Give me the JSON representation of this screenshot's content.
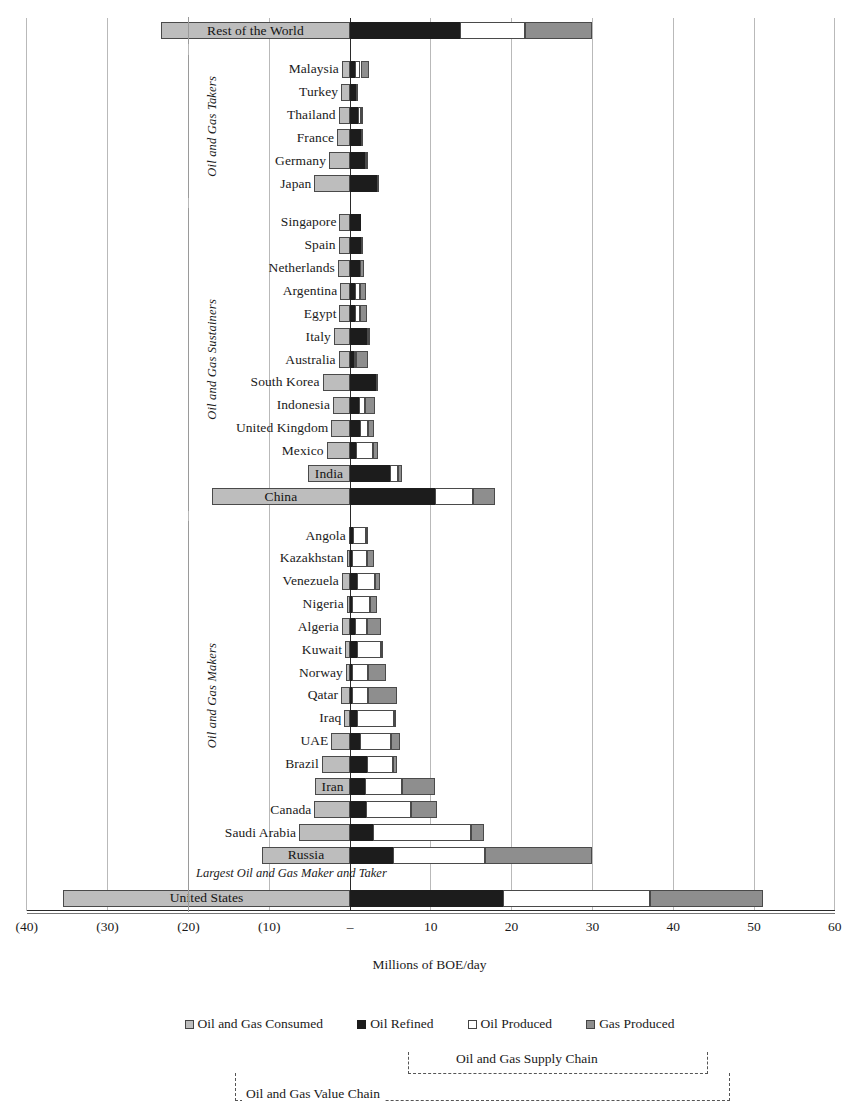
{
  "chart_data": {
    "type": "bar",
    "orientation": "horizontal",
    "stacked": true,
    "title": "",
    "xlabel": "Millions of BOE/day",
    "ylabel": "",
    "xlim": [
      -40,
      60
    ],
    "xticks": [
      -40,
      -30,
      -20,
      -10,
      0,
      10,
      20,
      30,
      40,
      50,
      60
    ],
    "xticklabels": [
      "(40)",
      "(30)",
      "(20)",
      "(10)",
      "–",
      "10",
      "20",
      "30",
      "40",
      "50",
      "60"
    ],
    "grid": "vertical",
    "legend_position": "bottom",
    "series": [
      {
        "name": "Oil and Gas Consumed",
        "color": "#bdbdbd",
        "direction": "negative"
      },
      {
        "name": "Oil Refined",
        "color": "#1c1c1c",
        "direction": "positive"
      },
      {
        "name": "Oil Produced",
        "color": "#ffffff",
        "direction": "positive"
      },
      {
        "name": "Gas Produced",
        "color": "#8e8e8e",
        "direction": "positive"
      }
    ],
    "groups": [
      {
        "label": "",
        "rows": [
          "Rest of the World"
        ]
      },
      {
        "label": "Oil and Gas Takers",
        "rows": [
          "Malaysia",
          "Turkey",
          "Thailand",
          "France",
          "Germany",
          "Japan"
        ]
      },
      {
        "label": "Oil and Gas Sustainers",
        "rows": [
          "Singapore",
          "Spain",
          "Netherlands",
          "Argentina",
          "Egypt",
          "Italy",
          "Australia",
          "South Korea",
          "Indonesia",
          "United Kingdom",
          "Mexico",
          "India",
          "China"
        ]
      },
      {
        "label": "Oil and Gas Makers",
        "rows": [
          "Angola",
          "Kazakhstan",
          "Venezuela",
          "Nigeria",
          "Algeria",
          "Kuwait",
          "Norway",
          "Qatar",
          "Iraq",
          "UAE",
          "Brazil",
          "Iran",
          "Canada",
          "Saudi Arabia",
          "Russia"
        ]
      },
      {
        "label": "Largest Oil and Gas Maker and Taker",
        "rows": [
          "United States"
        ]
      }
    ],
    "rows": [
      {
        "name": "Rest of the World",
        "consumed": 23.4,
        "refined": 13.6,
        "oil_produced": 8.1,
        "gas_produced": 8.2,
        "label_inside": true
      },
      {
        "name": "Malaysia",
        "consumed": 1.0,
        "refined": 0.6,
        "oil_produced": 0.7,
        "gas_produced": 1.0,
        "label_inside": false
      },
      {
        "name": "Turkey",
        "consumed": 1.1,
        "refined": 0.7,
        "oil_produced": 0.1,
        "gas_produced": 0.05,
        "label_inside": false
      },
      {
        "name": "Thailand",
        "consumed": 1.4,
        "refined": 1.0,
        "oil_produced": 0.3,
        "gas_produced": 0.2,
        "label_inside": false
      },
      {
        "name": "France",
        "consumed": 1.6,
        "refined": 1.3,
        "oil_produced": 0.05,
        "gas_produced": 0.03,
        "label_inside": false
      },
      {
        "name": "Germany",
        "consumed": 2.6,
        "refined": 1.9,
        "oil_produced": 0.1,
        "gas_produced": 0.2,
        "label_inside": false
      },
      {
        "name": "Japan",
        "consumed": 4.4,
        "refined": 3.3,
        "oil_produced": 0.05,
        "gas_produced": 0.05,
        "label_inside": false
      },
      {
        "name": "Singapore",
        "consumed": 1.3,
        "refined": 1.3,
        "oil_produced": 0.0,
        "gas_produced": 0.0,
        "label_inside": false
      },
      {
        "name": "Spain",
        "consumed": 1.4,
        "refined": 1.4,
        "oil_produced": 0.05,
        "gas_produced": 0.02,
        "label_inside": false
      },
      {
        "name": "Netherlands",
        "consumed": 1.5,
        "refined": 1.2,
        "oil_produced": 0.05,
        "gas_produced": 0.5,
        "label_inside": false
      },
      {
        "name": "Argentina",
        "consumed": 1.2,
        "refined": 0.6,
        "oil_produced": 0.6,
        "gas_produced": 0.8,
        "label_inside": false
      },
      {
        "name": "Egypt",
        "consumed": 1.3,
        "refined": 0.6,
        "oil_produced": 0.6,
        "gas_produced": 0.9,
        "label_inside": false
      },
      {
        "name": "Italy",
        "consumed": 2.0,
        "refined": 2.1,
        "oil_produced": 0.1,
        "gas_produced": 0.1,
        "label_inside": false
      },
      {
        "name": "Australia",
        "consumed": 1.4,
        "refined": 0.5,
        "oil_produced": 0.3,
        "gas_produced": 1.4,
        "label_inside": false
      },
      {
        "name": "South Korea",
        "consumed": 3.4,
        "refined": 3.2,
        "oil_produced": 0.0,
        "gas_produced": 0.05,
        "label_inside": false
      },
      {
        "name": "Indonesia",
        "consumed": 2.1,
        "refined": 1.1,
        "oil_produced": 0.8,
        "gas_produced": 1.2,
        "label_inside": false
      },
      {
        "name": "United Kingdom",
        "consumed": 2.3,
        "refined": 1.2,
        "oil_produced": 1.0,
        "gas_produced": 0.8,
        "label_inside": false
      },
      {
        "name": "Mexico",
        "consumed": 2.9,
        "refined": 0.8,
        "oil_produced": 2.1,
        "gas_produced": 0.6,
        "label_inside": false
      },
      {
        "name": "India",
        "consumed": 5.2,
        "refined": 5.0,
        "oil_produced": 0.9,
        "gas_produced": 0.5,
        "label_inside": true
      },
      {
        "name": "China",
        "consumed": 17.1,
        "refined": 10.5,
        "oil_produced": 4.7,
        "gas_produced": 2.7,
        "label_inside": true
      },
      {
        "name": "Angola",
        "consumed": 0.15,
        "refined": 0.4,
        "oil_produced": 1.6,
        "gas_produced": 0.1,
        "label_inside": false
      },
      {
        "name": "Kazakhstan",
        "consumed": 0.4,
        "refined": 0.3,
        "oil_produced": 1.8,
        "gas_produced": 0.9,
        "label_inside": false
      },
      {
        "name": "Venezuela",
        "consumed": 1.0,
        "refined": 0.9,
        "oil_produced": 2.2,
        "gas_produced": 0.6,
        "label_inside": false
      },
      {
        "name": "Nigeria",
        "consumed": 0.4,
        "refined": 0.2,
        "oil_produced": 2.3,
        "gas_produced": 0.9,
        "label_inside": false
      },
      {
        "name": "Algeria",
        "consumed": 1.0,
        "refined": 0.6,
        "oil_produced": 1.5,
        "gas_produced": 1.8,
        "label_inside": false
      },
      {
        "name": "Kuwait",
        "consumed": 0.6,
        "refined": 0.9,
        "oil_produced": 2.9,
        "gas_produced": 0.3,
        "label_inside": false
      },
      {
        "name": "Norway",
        "consumed": 0.5,
        "refined": 0.3,
        "oil_produced": 1.9,
        "gas_produced": 2.3,
        "label_inside": false
      },
      {
        "name": "Qatar",
        "consumed": 1.1,
        "refined": 0.3,
        "oil_produced": 1.9,
        "gas_produced": 3.6,
        "label_inside": false
      },
      {
        "name": "Iraq",
        "consumed": 0.7,
        "refined": 0.9,
        "oil_produced": 4.6,
        "gas_produced": 0.2,
        "label_inside": false
      },
      {
        "name": "UAE",
        "consumed": 2.3,
        "refined": 1.2,
        "oil_produced": 3.9,
        "gas_produced": 1.1,
        "label_inside": false
      },
      {
        "name": "Brazil",
        "consumed": 3.5,
        "refined": 2.1,
        "oil_produced": 3.2,
        "gas_produced": 0.5,
        "label_inside": false
      },
      {
        "name": "Iran",
        "consumed": 4.3,
        "refined": 1.8,
        "oil_produced": 4.6,
        "gas_produced": 4.1,
        "label_inside": true
      },
      {
        "name": "Canada",
        "consumed": 4.4,
        "refined": 2.0,
        "oil_produced": 5.5,
        "gas_produced": 3.3,
        "label_inside": false
      },
      {
        "name": "Saudi Arabia",
        "consumed": 6.3,
        "refined": 2.9,
        "oil_produced": 12.1,
        "gas_produced": 1.6,
        "label_inside": false
      },
      {
        "name": "Russia",
        "consumed": 10.9,
        "refined": 5.3,
        "oil_produced": 11.4,
        "gas_produced": 13.2,
        "label_inside": true
      },
      {
        "name": "United States",
        "consumed": 35.5,
        "refined": 18.9,
        "oil_produced": 18.2,
        "gas_produced": 14.0,
        "label_inside": true
      }
    ],
    "annotations": [
      {
        "text": "Largest Oil and Gas Maker and Taker",
        "style": "italic"
      },
      {
        "text": "Oil and Gas Supply Chain",
        "style": "dashed-bracket"
      },
      {
        "text": "Oil and Gas Value Chain",
        "style": "dashed-bracket"
      }
    ]
  },
  "axis": {
    "title": "Millions of BOE/day",
    "ticks": [
      "(40)",
      "(30)",
      "(20)",
      "(10)",
      "–",
      "10",
      "20",
      "30",
      "40",
      "50",
      "60"
    ]
  },
  "legend": {
    "items": [
      {
        "label": "Oil and Gas Consumed",
        "key": "consumed"
      },
      {
        "label": "Oil Refined",
        "key": "refined"
      },
      {
        "label": "Oil Produced",
        "key": "oilprod"
      },
      {
        "label": "Gas Produced",
        "key": "gasprod"
      }
    ]
  },
  "groups": {
    "takers": "Oil and Gas Takers",
    "sustainers": "Oil and Gas Sustainers",
    "makers": "Oil and Gas Makers",
    "largest": "Largest Oil and Gas Maker and Taker"
  },
  "brackets": {
    "supply_chain": "Oil and Gas Supply Chain",
    "value_chain": "Oil and Gas Value Chain"
  },
  "colors": {
    "consumed": "#bdbdbd",
    "refined": "#1c1c1c",
    "oil_produced": "#ffffff",
    "gas_produced": "#8e8e8e",
    "gridline": "#b9b9b9",
    "axis": "#2a2a2a"
  }
}
